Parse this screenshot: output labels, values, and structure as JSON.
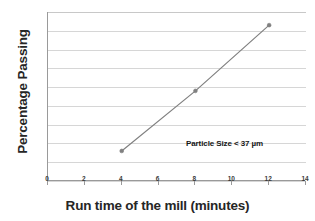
{
  "chart_data": {
    "type": "line",
    "title": "",
    "xlabel": "Run time of the mill (minutes)",
    "ylabel": "Percentage Passing",
    "xlim": [
      0,
      14
    ],
    "ylim": [
      50,
      95
    ],
    "xticks": [
      0,
      2,
      4,
      6,
      8,
      10,
      12,
      14
    ],
    "yticks": [
      50,
      55,
      60,
      65,
      70,
      75,
      80,
      85,
      90,
      95
    ],
    "grid": "horizontal",
    "legend": "none",
    "annotations": [
      {
        "text": "Particle Size < 37 µm",
        "x": 8.9,
        "y": 58.8
      }
    ],
    "series": [
      {
        "name": "Percentage Passing",
        "color": "#808080",
        "marker": "circle",
        "x": [
          4,
          8,
          12
        ],
        "values": [
          58,
          74,
          91.5
        ]
      }
    ]
  },
  "axis": {
    "x_title": "Run time of the mill (minutes)",
    "y_title": "Percentage Passing",
    "x_tick_labels": [
      "0",
      "2",
      "4",
      "6",
      "8",
      "10",
      "12",
      "14"
    ],
    "y_tick_labels": [
      "95",
      "90",
      "85",
      "80",
      "75",
      "70",
      "65",
      "60",
      "55",
      "50"
    ]
  },
  "annotation": {
    "text": "Particle Size < 37 µm"
  },
  "colors": {
    "series_line": "#808080",
    "gridline": "#d6d6d6",
    "axis": "#9a9a9a",
    "text": "#262626",
    "background": "#ffffff"
  }
}
